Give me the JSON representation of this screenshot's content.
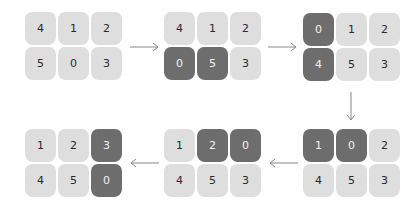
{
  "diagram": {
    "colors": {
      "tile_light": "#dedede",
      "tile_dark": "#6d6d6d",
      "arrow": "#888888",
      "background": "#ffffff"
    },
    "states": [
      {
        "id": "state-1",
        "x": 25,
        "y": 12,
        "tiles": [
          "4",
          "1",
          "2",
          "5",
          "0",
          "3"
        ],
        "highlighted": []
      },
      {
        "id": "state-2",
        "x": 164,
        "y": 12,
        "tiles": [
          "4",
          "1",
          "2",
          "0",
          "5",
          "3"
        ],
        "highlighted": [
          3,
          4
        ]
      },
      {
        "id": "state-3",
        "x": 303,
        "y": 13,
        "tiles": [
          "0",
          "1",
          "2",
          "4",
          "5",
          "3"
        ],
        "highlighted": [
          0,
          3
        ]
      },
      {
        "id": "state-4",
        "x": 303,
        "y": 129,
        "tiles": [
          "1",
          "0",
          "2",
          "4",
          "5",
          "3"
        ],
        "highlighted": [
          0,
          1
        ]
      },
      {
        "id": "state-5",
        "x": 164,
        "y": 129,
        "tiles": [
          "1",
          "2",
          "0",
          "4",
          "5",
          "3"
        ],
        "highlighted": [
          1,
          2
        ]
      },
      {
        "id": "state-6",
        "x": 25,
        "y": 129,
        "tiles": [
          "1",
          "2",
          "3",
          "4",
          "5",
          "0"
        ],
        "highlighted": [
          2,
          5
        ]
      }
    ],
    "arrows": [
      {
        "id": "arrow-1-2",
        "direction": "right",
        "from": "state-1",
        "to": "state-2"
      },
      {
        "id": "arrow-2-3",
        "direction": "right",
        "from": "state-2",
        "to": "state-3"
      },
      {
        "id": "arrow-3-4",
        "direction": "down",
        "from": "state-3",
        "to": "state-4"
      },
      {
        "id": "arrow-4-5",
        "direction": "left",
        "from": "state-4",
        "to": "state-5"
      },
      {
        "id": "arrow-5-6",
        "direction": "left",
        "from": "state-5",
        "to": "state-6"
      }
    ]
  }
}
